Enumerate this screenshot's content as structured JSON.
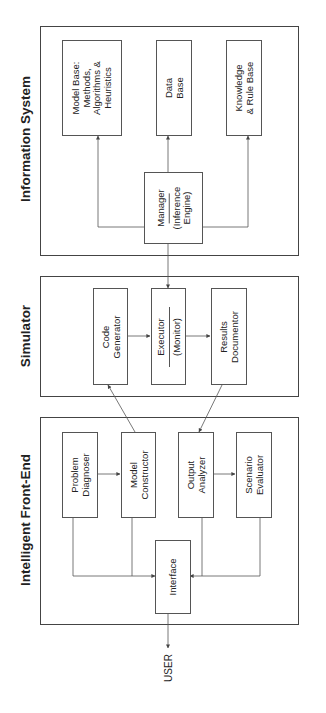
{
  "diagram": {
    "orientation": "rotated-90-ccw",
    "sections": {
      "information_system": {
        "title": "Information System",
        "components": {
          "model_base": {
            "line1": "Model Base:",
            "line2": "Methods,",
            "line3": "Algorithms &",
            "line4": "Heuristics"
          },
          "data_base": {
            "line1": "Data",
            "line2": "Base"
          },
          "knowledge_base": {
            "line1": "Knowledge",
            "line2": "& Rule Base"
          },
          "manager": {
            "line1": "Manager",
            "line2": "(Inference",
            "line3": "Engine)"
          }
        }
      },
      "simulator": {
        "title": "Simulator",
        "components": {
          "code_generator": {
            "line1": "Code",
            "line2": "Generator"
          },
          "executor": {
            "line1": "Executor",
            "line2": "(Monitor)"
          },
          "results_documentor": {
            "line1": "Results",
            "line2": "Documentor"
          }
        }
      },
      "front_end": {
        "title": "Intelligent Front-End",
        "components": {
          "problem_diagnoser": {
            "line1": "Problem",
            "line2": "Diagnoser"
          },
          "model_constructor": {
            "line1": "Model",
            "line2": "Constructor"
          },
          "output_analyzer": {
            "line1": "Output",
            "line2": "Analyzer"
          },
          "scenario_evaluator": {
            "line1": "Scenario",
            "line2": "Evaluator"
          },
          "interface": {
            "line1": "Interface"
          }
        }
      }
    },
    "external": {
      "user": "USER"
    },
    "connections": [
      {
        "from": "Manager",
        "to": "Model Base",
        "type": "bidirectional"
      },
      {
        "from": "Manager",
        "to": "Data Base",
        "type": "bidirectional"
      },
      {
        "from": "Manager",
        "to": "Knowledge & Rule Base",
        "type": "bidirectional"
      },
      {
        "from": "Manager",
        "to": "Executor",
        "type": "bidirectional"
      },
      {
        "from": "Code Generator",
        "to": "Executor",
        "type": "directed"
      },
      {
        "from": "Executor",
        "to": "Results Documentor",
        "type": "directed"
      },
      {
        "from": "Model Constructor",
        "to": "Code Generator",
        "type": "directed"
      },
      {
        "from": "Results Documentor",
        "to": "Output Analyzer",
        "type": "directed"
      },
      {
        "from": "Problem Diagnoser",
        "to": "Model Constructor",
        "type": "directed"
      },
      {
        "from": "Output Analyzer",
        "to": "Scenario Evaluator",
        "type": "directed"
      },
      {
        "from": "Interface",
        "to": "Problem Diagnoser",
        "type": "bidirectional"
      },
      {
        "from": "Interface",
        "to": "Model Constructor",
        "type": "bidirectional"
      },
      {
        "from": "Interface",
        "to": "Output Analyzer",
        "type": "bidirectional"
      },
      {
        "from": "Interface",
        "to": "Scenario Evaluator",
        "type": "bidirectional"
      },
      {
        "from": "Interface",
        "to": "USER",
        "type": "bidirectional"
      }
    ],
    "colors": {
      "line": "#444444",
      "text": "#222222",
      "background": "#ffffff"
    }
  }
}
